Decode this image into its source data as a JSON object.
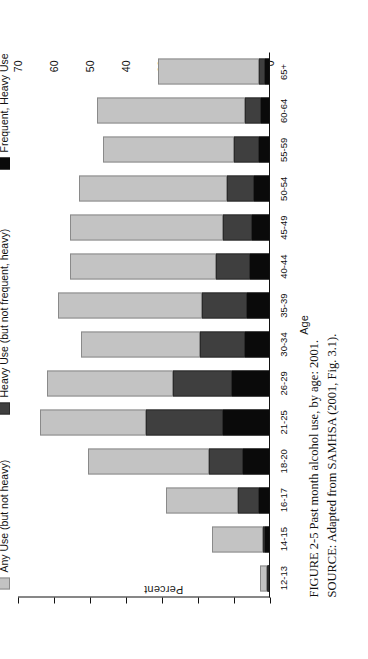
{
  "figure": {
    "caption_line1": "FIGURE 2-5  Past month alcohol use, by age:  2001.",
    "caption_line2": "SOURCE:  Adapted from SAMHSA (2001, Fig. 3.1)."
  },
  "legend": {
    "items": [
      {
        "label": "Any Use (but not heavy)",
        "key": "any",
        "color": "#c3c3c3"
      },
      {
        "label": "Heavy Use (but not frequent, heavy)",
        "key": "heavy",
        "color": "#3f3f3f"
      },
      {
        "label": "Frequent, Heavy Use",
        "key": "frequent",
        "color": "#0a0a0a"
      }
    ]
  },
  "chart_data": {
    "type": "bar",
    "subtype": "stacked-bar",
    "title": "",
    "xlabel": "Age",
    "ylabel": "Percent",
    "ylim": [
      0,
      70
    ],
    "yticks": [
      0,
      10,
      20,
      30,
      40,
      50,
      60,
      70
    ],
    "ytick_labels": [
      "0",
      "10",
      "20",
      "30",
      "40",
      "50",
      "60",
      "70"
    ],
    "grid": false,
    "legend_position": "top-left",
    "orientation": "vertical-bars-rotated-page",
    "categories": [
      "12-13",
      "14-15",
      "16-17",
      "18-20",
      "21-25",
      "26-29",
      "30-34",
      "35-39",
      "40-44",
      "45-49",
      "50-54",
      "55-59",
      "60-64",
      "65+"
    ],
    "series": [
      {
        "name": "Frequent, Heavy Use",
        "key": "frequent",
        "color": "#0a0a0a",
        "values": [
          0.3,
          1.4,
          3.0,
          7.5,
          13.0,
          10.5,
          7.0,
          6.5,
          5.5,
          5.0,
          4.5,
          3.0,
          2.5,
          1.5
        ]
      },
      {
        "name": "Heavy Use (but not frequent, heavy)",
        "key": "heavy",
        "color": "#3f3f3f",
        "values": [
          0.6,
          0.6,
          6.0,
          9.5,
          21.5,
          16.5,
          12.5,
          12.5,
          9.5,
          8.0,
          7.5,
          7.0,
          4.5,
          1.5
        ]
      },
      {
        "name": "Any Use (but not heavy)",
        "key": "any",
        "color": "#c3c3c3",
        "values": [
          1.8,
          14.0,
          20.0,
          33.5,
          29.5,
          35.0,
          33.0,
          40.0,
          40.5,
          42.5,
          41.0,
          36.5,
          41.0,
          28.0
        ]
      }
    ],
    "totals": [
      2.7,
      16.0,
      29.0,
      50.5,
      64.0,
      62.0,
      52.5,
      59.0,
      55.5,
      55.5,
      53.0,
      46.5,
      48.0,
      31.0
    ]
  }
}
